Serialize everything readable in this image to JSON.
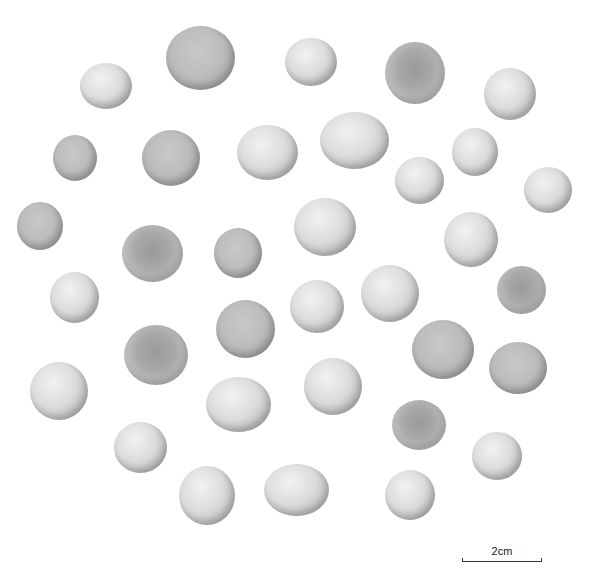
{
  "image": {
    "description": "Photograph of 36 small rounded stone/clay beads or pellets on white background",
    "background": "#ffffff",
    "object_count": 36
  },
  "scale_bar": {
    "label": "2cm",
    "length_px": 80
  },
  "objects": [
    {
      "x": 80,
      "y": 63,
      "w": 52,
      "h": 46,
      "tone": "light"
    },
    {
      "x": 166,
      "y": 26,
      "w": 69,
      "h": 64,
      "tone": "mid"
    },
    {
      "x": 285,
      "y": 38,
      "w": 52,
      "h": 48,
      "tone": "light"
    },
    {
      "x": 385,
      "y": 42,
      "w": 60,
      "h": 62,
      "tone": "dark"
    },
    {
      "x": 484,
      "y": 68,
      "w": 52,
      "h": 52,
      "tone": "light"
    },
    {
      "x": 53,
      "y": 135,
      "w": 44,
      "h": 46,
      "tone": "mid"
    },
    {
      "x": 142,
      "y": 130,
      "w": 58,
      "h": 56,
      "tone": "mid"
    },
    {
      "x": 237,
      "y": 125,
      "w": 61,
      "h": 55,
      "tone": "light"
    },
    {
      "x": 320,
      "y": 112,
      "w": 69,
      "h": 57,
      "tone": "light"
    },
    {
      "x": 452,
      "y": 128,
      "w": 46,
      "h": 48,
      "tone": "light"
    },
    {
      "x": 395,
      "y": 157,
      "w": 49,
      "h": 47,
      "tone": "light"
    },
    {
      "x": 524,
      "y": 167,
      "w": 48,
      "h": 46,
      "tone": "light"
    },
    {
      "x": 17,
      "y": 202,
      "w": 46,
      "h": 48,
      "tone": "mid"
    },
    {
      "x": 122,
      "y": 225,
      "w": 61,
      "h": 57,
      "tone": "dark"
    },
    {
      "x": 214,
      "y": 228,
      "w": 48,
      "h": 50,
      "tone": "mid"
    },
    {
      "x": 294,
      "y": 198,
      "w": 62,
      "h": 58,
      "tone": "light"
    },
    {
      "x": 444,
      "y": 212,
      "w": 54,
      "h": 55,
      "tone": "light"
    },
    {
      "x": 50,
      "y": 272,
      "w": 49,
      "h": 51,
      "tone": "light"
    },
    {
      "x": 290,
      "y": 280,
      "w": 54,
      "h": 53,
      "tone": "light"
    },
    {
      "x": 361,
      "y": 265,
      "w": 58,
      "h": 57,
      "tone": "light"
    },
    {
      "x": 497,
      "y": 266,
      "w": 49,
      "h": 48,
      "tone": "dark"
    },
    {
      "x": 216,
      "y": 300,
      "w": 59,
      "h": 58,
      "tone": "mid"
    },
    {
      "x": 124,
      "y": 325,
      "w": 64,
      "h": 60,
      "tone": "dark"
    },
    {
      "x": 412,
      "y": 320,
      "w": 62,
      "h": 59,
      "tone": "mid"
    },
    {
      "x": 489,
      "y": 342,
      "w": 58,
      "h": 52,
      "tone": "mid"
    },
    {
      "x": 30,
      "y": 362,
      "w": 58,
      "h": 58,
      "tone": "light"
    },
    {
      "x": 206,
      "y": 377,
      "w": 65,
      "h": 55,
      "tone": "light"
    },
    {
      "x": 304,
      "y": 358,
      "w": 58,
      "h": 57,
      "tone": "light"
    },
    {
      "x": 392,
      "y": 400,
      "w": 54,
      "h": 50,
      "tone": "dark"
    },
    {
      "x": 114,
      "y": 422,
      "w": 53,
      "h": 51,
      "tone": "light"
    },
    {
      "x": 472,
      "y": 432,
      "w": 50,
      "h": 48,
      "tone": "light"
    },
    {
      "x": 179,
      "y": 466,
      "w": 56,
      "h": 59,
      "tone": "light"
    },
    {
      "x": 264,
      "y": 464,
      "w": 65,
      "h": 52,
      "tone": "light"
    },
    {
      "x": 385,
      "y": 470,
      "w": 50,
      "h": 50,
      "tone": "light"
    }
  ]
}
